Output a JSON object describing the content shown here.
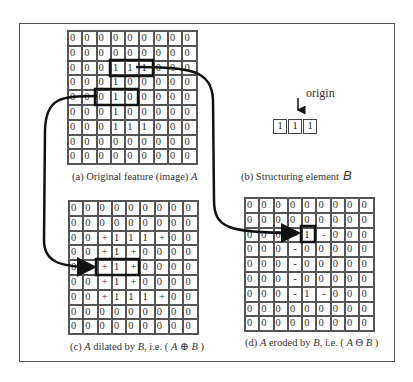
{
  "figure": {
    "panels": {
      "a": {
        "caption_prefix": "(a) Original feature (image) ",
        "caption_symbol": "A",
        "grid": [
          [
            "0",
            "0",
            "0",
            "0",
            "0",
            "0",
            "0",
            "0",
            "0"
          ],
          [
            "0",
            "0",
            "0",
            "0",
            "0",
            "0",
            "0",
            "0",
            "0"
          ],
          [
            "0",
            "0",
            "0",
            "1",
            "1",
            "1",
            "0",
            "0",
            "0"
          ],
          [
            "0",
            "0",
            "0",
            "1",
            "0",
            "0",
            "0",
            "0",
            "0"
          ],
          [
            "0",
            "0",
            "0",
            "1",
            "0",
            "0",
            "0",
            "0",
            "0"
          ],
          [
            "0",
            "0",
            "0",
            "1",
            "0",
            "0",
            "0",
            "0",
            "0"
          ],
          [
            "0",
            "0",
            "0",
            "1",
            "1",
            "1",
            "0",
            "0",
            "0"
          ],
          [
            "0",
            "0",
            "0",
            "0",
            "0",
            "0",
            "0",
            "0",
            "0"
          ],
          [
            "0",
            "0",
            "0",
            "0",
            "0",
            "0",
            "0",
            "0",
            "0"
          ]
        ],
        "highlights": [
          {
            "row": 2,
            "col_start": 3,
            "col_end": 5
          },
          {
            "row": 4,
            "col_start": 2,
            "col_end": 4
          }
        ]
      },
      "b": {
        "caption_prefix": "(b)  Structuring element",
        "caption_symbol": "B",
        "origin_label": "origin",
        "origin_index": 1,
        "element": [
          "1",
          "1",
          "1"
        ]
      },
      "c": {
        "caption": "(c) A dilated by B, i.e. ( A ⊕ B )",
        "caption_parts": [
          "(c) ",
          "A",
          " dilated by ",
          "B",
          ", i.e. ( ",
          "A",
          " ⊕ ",
          "B",
          " )"
        ],
        "grid": [
          [
            "0",
            "0",
            "0",
            "0",
            "0",
            "0",
            "0",
            "0",
            "0"
          ],
          [
            "0",
            "0",
            "0",
            "0",
            "0",
            "0",
            "0",
            "0",
            "0"
          ],
          [
            "0",
            "0",
            "+",
            "1",
            "1",
            "1",
            "+",
            "0",
            "0"
          ],
          [
            "0",
            "0",
            "+",
            "1",
            "+",
            "0",
            "0",
            "0",
            "0"
          ],
          [
            "0",
            "0",
            "+",
            "1",
            "+",
            "0",
            "0",
            "0",
            "0"
          ],
          [
            "0",
            "0",
            "+",
            "1",
            "+",
            "0",
            "0",
            "0",
            "0"
          ],
          [
            "0",
            "0",
            "+",
            "1",
            "1",
            "1",
            "+",
            "0",
            "0"
          ],
          [
            "0",
            "0",
            "0",
            "0",
            "0",
            "0",
            "0",
            "0",
            "0"
          ],
          [
            "0",
            "0",
            "0",
            "0",
            "0",
            "0",
            "0",
            "0",
            "0"
          ]
        ],
        "highlights": [
          {
            "row": 4,
            "col_start": 2,
            "col_end": 4
          }
        ]
      },
      "d": {
        "caption": "(d) A eroded by B, i.e. ( A ⊖ B )",
        "caption_parts": [
          "(d) ",
          "A",
          " eroded by ",
          "B",
          ", i.e. ( ",
          "A",
          " Θ ",
          "B",
          " )"
        ],
        "grid": [
          [
            "0",
            "0",
            "0",
            "0",
            "0",
            "0",
            "0",
            "0",
            "0"
          ],
          [
            "0",
            "0",
            "0",
            "0",
            "0",
            "0",
            "0",
            "0",
            "0"
          ],
          [
            "0",
            "0",
            "0",
            "-",
            "1",
            "-",
            "0",
            "0",
            "0"
          ],
          [
            "0",
            "0",
            "0",
            "-",
            "0",
            "0",
            "0",
            "0",
            "0"
          ],
          [
            "0",
            "0",
            "0",
            "-",
            "0",
            "0",
            "0",
            "0",
            "0"
          ],
          [
            "0",
            "0",
            "0",
            "-",
            "0",
            "0",
            "0",
            "0",
            "0"
          ],
          [
            "0",
            "0",
            "0",
            "-",
            "1",
            "-",
            "0",
            "0",
            "0"
          ],
          [
            "0",
            "0",
            "0",
            "0",
            "0",
            "0",
            "0",
            "0",
            "0"
          ],
          [
            "0",
            "0",
            "0",
            "0",
            "0",
            "0",
            "0",
            "0",
            "0"
          ]
        ],
        "highlights": [
          {
            "row": 2,
            "col_start": 4,
            "col_end": 4
          }
        ]
      }
    },
    "arrows": [
      {
        "from": "a.row4.highlight",
        "to": "c.row4.highlight",
        "meaning": "dilation mapping"
      },
      {
        "from": "a.row2.highlight",
        "to": "d.row2.col4",
        "meaning": "erosion mapping"
      }
    ]
  }
}
